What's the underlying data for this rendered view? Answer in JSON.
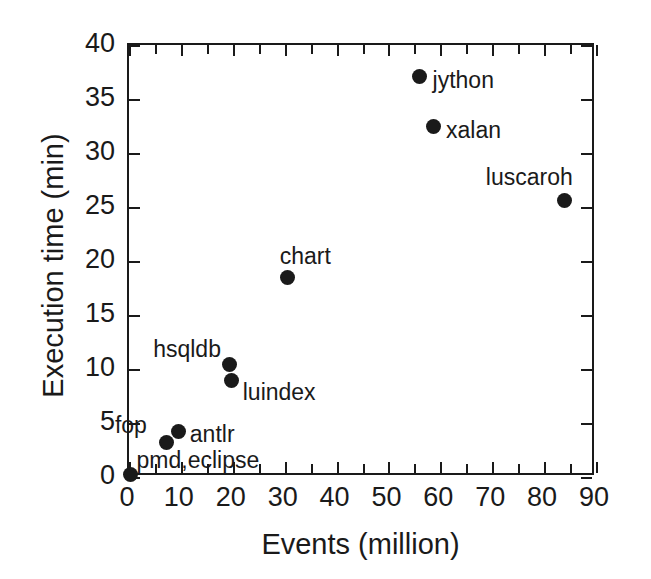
{
  "chart_data": {
    "type": "scatter",
    "title": "",
    "xlabel": "Events (million)",
    "ylabel": "Execution time (min)",
    "xlim": [
      0,
      90
    ],
    "ylim": [
      0,
      40
    ],
    "xticks": [
      0,
      10,
      20,
      30,
      40,
      50,
      60,
      70,
      80,
      90
    ],
    "yticks": [
      0,
      5,
      10,
      15,
      20,
      25,
      30,
      35,
      40
    ],
    "xticklabels": [
      "0",
      "10",
      "20",
      "30",
      "40",
      "50",
      "60",
      "70",
      "80",
      "90"
    ],
    "yticklabels": [
      "0",
      "5",
      "10",
      "15",
      "20",
      "25",
      "30",
      "35",
      "40"
    ],
    "x_minor_ticks": [
      5,
      15,
      25,
      35,
      45,
      55,
      65,
      75,
      85
    ],
    "grid": false,
    "legend": false,
    "frame": "box",
    "tick_direction": "in",
    "marker": "filled-circle",
    "marker_color": "#1a1a1a",
    "points": [
      {
        "label": "pmd,eclipse",
        "x": 0.3,
        "y": 0.2,
        "label_dx": 6,
        "label_dy": -26
      },
      {
        "label": "fop",
        "x": 7.3,
        "y": 3.2,
        "label_dx": -52,
        "label_dy": -28
      },
      {
        "label": "antlr",
        "x": 9.6,
        "y": 4.2,
        "label_dx": 11,
        "label_dy": -9
      },
      {
        "label": "luindex",
        "x": 19.8,
        "y": 8.9,
        "label_dx": 11,
        "label_dy": 0
      },
      {
        "label": "hsqldb",
        "x": 19.3,
        "y": 10.4,
        "label_dx": -76,
        "label_dy": -27
      },
      {
        "label": "chart",
        "x": 30.6,
        "y": 18.5,
        "label_dx": -8,
        "label_dy": -32
      },
      {
        "label": "jython",
        "x": 56.0,
        "y": 37.1,
        "label_dx": 13,
        "label_dy": -7
      },
      {
        "label": "xalan",
        "x": 58.6,
        "y": 32.5,
        "label_dx": 13,
        "label_dy": -7
      },
      {
        "label": "luscaroh",
        "x": 84.0,
        "y": 25.6,
        "label_dx": -79,
        "label_dy": -35
      }
    ]
  }
}
